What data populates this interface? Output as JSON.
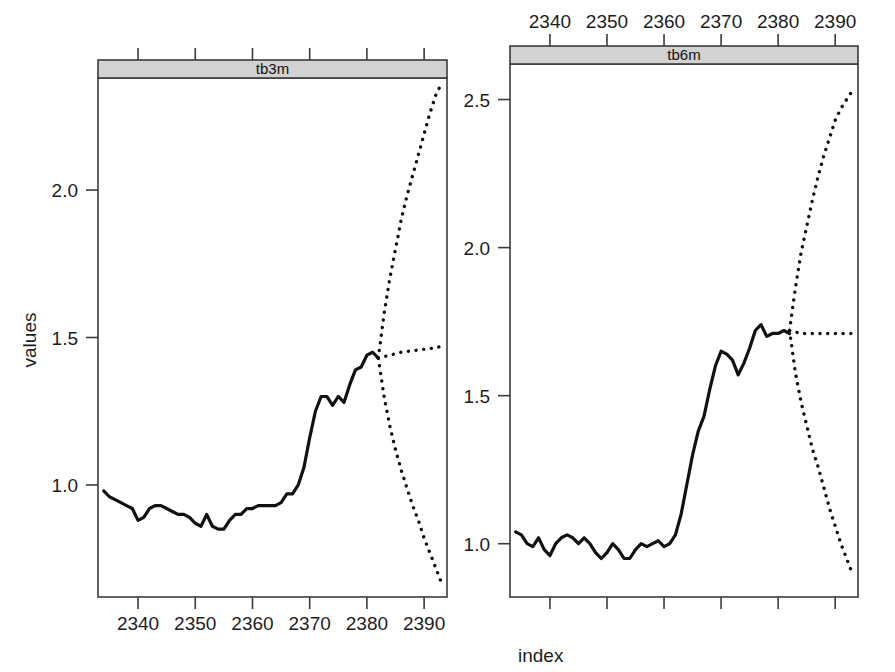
{
  "figure": {
    "xlabel": "index",
    "ylabel": "values",
    "background": "#ffffff",
    "line_color": "#111111",
    "strip_color": "#d2d2d2",
    "frame_color": "#3b3b3b"
  },
  "chart_data": {
    "type": "line",
    "title": "",
    "xlabel": "index",
    "ylabel": "values",
    "grid": false,
    "legend": "none",
    "layout": "2 panels side-by-side (trellis / lattice conditioned on series)",
    "panels": [
      {
        "name": "tb3m",
        "strip_label": "tb3m",
        "xlim": [
          2333,
          2394
        ],
        "ylim": [
          0.62,
          2.38
        ],
        "xticks": [
          2340,
          2350,
          2360,
          2370,
          2380,
          2390
        ],
        "xtick_labels": [
          "2340",
          "2350",
          "2360",
          "2370",
          "2380",
          "2390"
        ],
        "xtick_labels_position": "bottom",
        "top_ticks_labeled": false,
        "yticks": [
          1.0,
          1.5,
          2.0
        ],
        "ytick_labels": [
          "1.0",
          "1.5",
          "2.0"
        ],
        "series": [
          {
            "name": "observed",
            "style": "solid",
            "x": [
              2334,
              2335,
              2336,
              2337,
              2338,
              2339,
              2340,
              2341,
              2342,
              2343,
              2344,
              2345,
              2346,
              2347,
              2348,
              2349,
              2350,
              2351,
              2352,
              2353,
              2354,
              2355,
              2356,
              2357,
              2358,
              2359,
              2360,
              2361,
              2362,
              2363,
              2364,
              2365,
              2366,
              2367,
              2368,
              2369,
              2370,
              2371,
              2372,
              2373,
              2374,
              2375,
              2376,
              2377,
              2378,
              2379,
              2380,
              2381,
              2382
            ],
            "values": [
              0.98,
              0.96,
              0.95,
              0.94,
              0.93,
              0.92,
              0.88,
              0.89,
              0.92,
              0.93,
              0.93,
              0.92,
              0.91,
              0.9,
              0.9,
              0.89,
              0.87,
              0.86,
              0.9,
              0.86,
              0.85,
              0.85,
              0.88,
              0.9,
              0.9,
              0.92,
              0.92,
              0.93,
              0.93,
              0.93,
              0.93,
              0.94,
              0.97,
              0.97,
              1.0,
              1.06,
              1.16,
              1.25,
              1.3,
              1.3,
              1.27,
              1.3,
              1.28,
              1.34,
              1.39,
              1.4,
              1.44,
              1.45,
              1.43
            ]
          },
          {
            "name": "forecast-upper",
            "style": "dotted",
            "x": [
              2382,
              2383,
              2384,
              2385,
              2386,
              2387,
              2388,
              2389,
              2390,
              2391,
              2392,
              2393
            ],
            "values": [
              1.43,
              1.58,
              1.7,
              1.8,
              1.9,
              1.98,
              2.05,
              2.12,
              2.19,
              2.26,
              2.32,
              2.36
            ]
          },
          {
            "name": "forecast-mean",
            "style": "dotted",
            "x": [
              2382,
              2384,
              2386,
              2388,
              2390,
              2392,
              2393
            ],
            "values": [
              1.43,
              1.44,
              1.45,
              1.455,
              1.46,
              1.465,
              1.47
            ]
          },
          {
            "name": "forecast-lower",
            "style": "dotted",
            "x": [
              2382,
              2383,
              2384,
              2385,
              2386,
              2387,
              2388,
              2389,
              2390,
              2391,
              2392,
              2393
            ],
            "values": [
              1.43,
              1.3,
              1.2,
              1.12,
              1.05,
              0.99,
              0.93,
              0.88,
              0.82,
              0.77,
              0.72,
              0.67
            ]
          }
        ]
      },
      {
        "name": "tb6m",
        "strip_label": "tb6m",
        "xlim": [
          2333,
          2394
        ],
        "ylim": [
          0.82,
          2.62
        ],
        "xticks": [
          2340,
          2350,
          2360,
          2370,
          2380,
          2390
        ],
        "xtick_labels": [
          "2340",
          "2350",
          "2360",
          "2370",
          "2380",
          "2390"
        ],
        "xtick_labels_position": "top",
        "bottom_ticks_labeled": false,
        "yticks": [
          1.0,
          1.5,
          2.0,
          2.5
        ],
        "ytick_labels": [
          "1.0",
          "1.5",
          "2.0",
          "2.5"
        ],
        "series": [
          {
            "name": "observed",
            "style": "solid",
            "x": [
              2334,
              2335,
              2336,
              2337,
              2338,
              2339,
              2340,
              2341,
              2342,
              2343,
              2344,
              2345,
              2346,
              2347,
              2348,
              2349,
              2350,
              2351,
              2352,
              2353,
              2354,
              2355,
              2356,
              2357,
              2358,
              2359,
              2360,
              2361,
              2362,
              2363,
              2364,
              2365,
              2366,
              2367,
              2368,
              2369,
              2370,
              2371,
              2372,
              2373,
              2374,
              2375,
              2376,
              2377,
              2378,
              2379,
              2380,
              2381,
              2382
            ],
            "values": [
              1.04,
              1.03,
              1.0,
              0.99,
              1.02,
              0.98,
              0.96,
              1.0,
              1.02,
              1.03,
              1.02,
              1.0,
              1.02,
              1.0,
              0.97,
              0.95,
              0.97,
              1.0,
              0.98,
              0.95,
              0.95,
              0.98,
              1.0,
              0.99,
              1.0,
              1.01,
              0.99,
              1.0,
              1.03,
              1.1,
              1.2,
              1.3,
              1.38,
              1.43,
              1.52,
              1.6,
              1.65,
              1.64,
              1.62,
              1.57,
              1.61,
              1.66,
              1.72,
              1.74,
              1.7,
              1.71,
              1.71,
              1.72,
              1.71
            ]
          },
          {
            "name": "forecast-upper",
            "style": "dotted",
            "x": [
              2382,
              2383,
              2384,
              2385,
              2386,
              2387,
              2388,
              2389,
              2390,
              2391,
              2392,
              2393
            ],
            "values": [
              1.72,
              1.86,
              1.98,
              2.07,
              2.16,
              2.24,
              2.31,
              2.37,
              2.43,
              2.47,
              2.5,
              2.53
            ]
          },
          {
            "name": "forecast-mean",
            "style": "dotted",
            "x": [
              2382,
              2384,
              2386,
              2388,
              2390,
              2392,
              2393
            ],
            "values": [
              1.72,
              1.71,
              1.71,
              1.71,
              1.71,
              1.71,
              1.71
            ]
          },
          {
            "name": "forecast-lower",
            "style": "dotted",
            "x": [
              2382,
              2383,
              2384,
              2385,
              2386,
              2387,
              2388,
              2389,
              2390,
              2391,
              2392,
              2393
            ],
            "values": [
              1.72,
              1.58,
              1.48,
              1.4,
              1.32,
              1.26,
              1.19,
              1.12,
              1.06,
              1.0,
              0.95,
              0.9
            ]
          }
        ]
      }
    ]
  }
}
